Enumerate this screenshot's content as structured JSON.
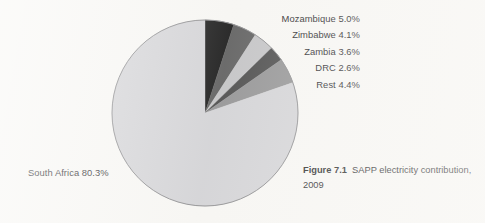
{
  "figure": {
    "caption_label": "Figure 7.1",
    "caption_text": "SAPP electricity contribution, 2009"
  },
  "labels": {
    "mozambique": "Mozambique 5.0%",
    "zimbabwe": "Zimbabwe 4.1%",
    "zambia": "Zambia 3.6%",
    "drc": "DRC 2.6%",
    "rest": "Rest 4.4%",
    "south_africa": "South Africa 80.3%"
  },
  "chart_data": {
    "type": "pie",
    "title": "SAPP electricity contribution, 2009",
    "subtitle": "",
    "xlabel": "",
    "ylabel": "",
    "unit": "percent",
    "start_angle_deg": 0,
    "direction": "clockwise",
    "total": 100.0,
    "legend_position": "outside-right-labels",
    "grid": false,
    "categories": [
      "Mozambique",
      "Zimbabwe",
      "Zambia",
      "DRC",
      "Rest",
      "South Africa"
    ],
    "values": [
      5.0,
      4.1,
      3.6,
      2.6,
      4.4,
      80.3
    ],
    "slices": [
      {
        "name": "Mozambique",
        "value": 5.0,
        "label": "Mozambique 5.0%",
        "color": "#151515"
      },
      {
        "name": "Zimbabwe",
        "value": 4.1,
        "label": "Zimbabwe 4.1%",
        "color": "#5c5c5c"
      },
      {
        "name": "Zambia",
        "value": 3.6,
        "label": "Zambia 3.6%",
        "color": "#c2c2c4"
      },
      {
        "name": "DRC",
        "value": 2.6,
        "label": "DRC 2.6%",
        "color": "#474747"
      },
      {
        "name": "Rest",
        "value": 4.4,
        "label": "Rest 4.4%",
        "color": "#919192"
      },
      {
        "name": "South Africa",
        "value": 80.3,
        "label": "South Africa 80.3%",
        "color": "#d2d2d5"
      }
    ]
  },
  "colors": {
    "background": "#f7f6f3",
    "outline": "#8d8d8f",
    "text": "#23221f"
  }
}
